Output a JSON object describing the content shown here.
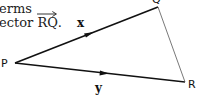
{
  "text": {
    "line1": "erms",
    "line2_prefix": "ector ",
    "line2_vector": "RQ",
    "line2_suffix": "."
  },
  "diagram": {
    "points": {
      "P": {
        "label": "P",
        "x": 15,
        "y": 63
      },
      "Q": {
        "label": "Q",
        "x": 160,
        "y": 7
      },
      "R": {
        "label": "R",
        "x": 185,
        "y": 82
      }
    },
    "vectors": [
      {
        "from": "P",
        "to": "Q",
        "label": "x"
      },
      {
        "from": "P",
        "to": "R",
        "label": "y"
      }
    ],
    "segments": [
      {
        "from": "Q",
        "to": "R"
      }
    ]
  },
  "colors": {
    "stroke": "#111111",
    "thin_stroke": "#555555",
    "background": "#ffffff"
  }
}
